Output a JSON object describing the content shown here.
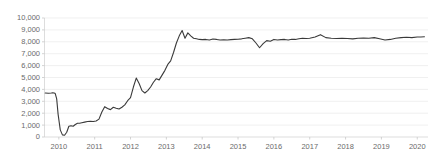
{
  "chart_data": {
    "type": "line",
    "title": "",
    "subtitle": "",
    "xlabel": "",
    "ylabel": "",
    "grid": true,
    "legend": false,
    "legend_position": "none",
    "line_color": "#3a3a3a",
    "grid_color": "#e9e9e9",
    "axis_color": "#d4d4d4",
    "tick_label_color": "#6b6b6b",
    "ylim": [
      0,
      10000
    ],
    "ytick_values": [
      0,
      1000,
      2000,
      3000,
      4000,
      5000,
      6000,
      7000,
      8000,
      9000,
      10000
    ],
    "ytick_labels": [
      "0",
      "1,000",
      "2,000",
      "3,000",
      "4,000",
      "5,000",
      "6,000",
      "7,000",
      "8,000",
      "9,000",
      "10,000"
    ],
    "xlim": [
      2009.6,
      2020.3
    ],
    "xtick_values": [
      2010,
      2011,
      2012,
      2013,
      2014,
      2015,
      2016,
      2017,
      2018,
      2019,
      2020
    ],
    "xtick_labels": [
      "2010",
      "2011",
      "2012",
      "2013",
      "2014",
      "2015",
      "2016",
      "2017",
      "2018",
      "2019",
      "2020"
    ],
    "series": [
      {
        "name": "series-1",
        "x": [
          2009.62,
          2009.71,
          2009.79,
          2009.83,
          2009.87,
          2009.9,
          2009.94,
          2009.98,
          2010.04,
          2010.1,
          2010.16,
          2010.22,
          2010.28,
          2010.34,
          2010.4,
          2010.46,
          2010.52,
          2010.58,
          2010.64,
          2010.72,
          2010.8,
          2010.88,
          2010.96,
          2011.04,
          2011.12,
          2011.2,
          2011.28,
          2011.36,
          2011.44,
          2011.52,
          2011.6,
          2011.68,
          2011.76,
          2011.84,
          2011.92,
          2012.0,
          2012.08,
          2012.16,
          2012.24,
          2012.32,
          2012.4,
          2012.48,
          2012.56,
          2012.64,
          2012.72,
          2012.8,
          2012.88,
          2012.96,
          2013.04,
          2013.12,
          2013.2,
          2013.28,
          2013.36,
          2013.44,
          2013.52,
          2013.6,
          2013.68,
          2013.76,
          2013.84,
          2013.92,
          2014.0,
          2014.1,
          2014.2,
          2014.3,
          2014.4,
          2014.5,
          2014.6,
          2014.7,
          2014.8,
          2014.9,
          2015.0,
          2015.1,
          2015.2,
          2015.3,
          2015.4,
          2015.5,
          2015.6,
          2015.7,
          2015.8,
          2015.9,
          2016.0,
          2016.1,
          2016.2,
          2016.3,
          2016.4,
          2016.5,
          2016.6,
          2016.7,
          2016.8,
          2016.9,
          2017.0,
          2017.15,
          2017.3,
          2017.45,
          2017.6,
          2017.75,
          2017.9,
          2018.05,
          2018.2,
          2018.35,
          2018.5,
          2018.65,
          2018.8,
          2018.95,
          2019.1,
          2019.25,
          2019.4,
          2019.55,
          2019.7,
          2019.85,
          2020.0,
          2020.1,
          2020.2
        ],
        "y": [
          3700,
          3680,
          3700,
          3720,
          3700,
          3650,
          3200,
          1900,
          600,
          180,
          150,
          400,
          900,
          950,
          900,
          1050,
          1150,
          1150,
          1200,
          1250,
          1300,
          1320,
          1300,
          1350,
          1500,
          2100,
          2550,
          2400,
          2300,
          2500,
          2420,
          2350,
          2500,
          2700,
          3050,
          3300,
          4200,
          4950,
          4500,
          3900,
          3700,
          3900,
          4200,
          4600,
          4900,
          4800,
          5200,
          5600,
          6100,
          6400,
          7100,
          7900,
          8500,
          8950,
          8300,
          8750,
          8500,
          8300,
          8250,
          8200,
          8180,
          8200,
          8150,
          8230,
          8200,
          8150,
          8170,
          8150,
          8180,
          8200,
          8220,
          8250,
          8300,
          8350,
          8250,
          7900,
          7500,
          7850,
          8100,
          8050,
          8200,
          8150,
          8180,
          8200,
          8150,
          8220,
          8200,
          8250,
          8300,
          8280,
          8300,
          8400,
          8600,
          8350,
          8300,
          8280,
          8300,
          8280,
          8250,
          8300,
          8320,
          8300,
          8350,
          8250,
          8150,
          8200,
          8300,
          8350,
          8380,
          8350,
          8400,
          8400,
          8420
        ]
      }
    ]
  }
}
